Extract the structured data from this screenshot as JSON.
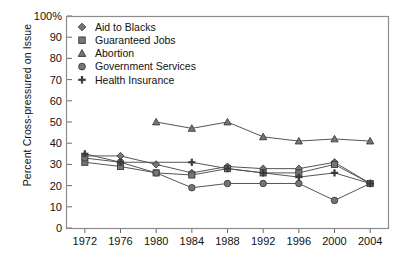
{
  "chart_data": {
    "type": "line",
    "title": "",
    "xlabel": "",
    "ylabel": "Percent Cross-pressured on Issue",
    "x": [
      1972,
      1976,
      1980,
      1984,
      1988,
      1992,
      1996,
      2000,
      2004
    ],
    "xticklabels": [
      "1972",
      "1976",
      "1980",
      "1984",
      "1988",
      "1992",
      "1996",
      "2000",
      "2004"
    ],
    "yticklabels": [
      "0",
      "10",
      "20",
      "30",
      "40",
      "50",
      "60",
      "70",
      "80",
      "90",
      "100%"
    ],
    "yticks": [
      0,
      10,
      20,
      30,
      40,
      50,
      60,
      70,
      80,
      90,
      100
    ],
    "ylim": [
      0,
      100
    ],
    "xlim": [
      1970,
      2006
    ],
    "grid": false,
    "legend_position": "top-left",
    "series": [
      {
        "name": "Aid to Blacks",
        "marker": "diamond",
        "x": [
          1972,
          1976,
          1980,
          1984,
          1988,
          1992,
          1996,
          2000,
          2004
        ],
        "values": [
          34,
          34,
          30,
          26,
          29,
          28,
          28,
          31,
          21
        ]
      },
      {
        "name": "Guaranteed Jobs",
        "marker": "square",
        "x": [
          1972,
          1976,
          1980,
          1984,
          1988,
          1992,
          1996,
          2000,
          2004
        ],
        "values": [
          31,
          29,
          26,
          25,
          28,
          26,
          26,
          30,
          21
        ]
      },
      {
        "name": "Abortion",
        "marker": "triangle",
        "x": [
          1980,
          1984,
          1988,
          1992,
          1996,
          2000,
          2004
        ],
        "values": [
          50,
          47,
          50,
          43,
          41,
          42,
          41
        ]
      },
      {
        "name": "Government Services",
        "marker": "circle",
        "x": [
          1972,
          1976,
          1980,
          1984,
          1988,
          1992,
          1996,
          2000,
          2004
        ],
        "values": [
          33,
          31,
          26,
          19,
          21,
          21,
          21,
          13,
          21
        ]
      },
      {
        "name": "Health Insurance",
        "marker": "plus",
        "x": [
          1972,
          1976,
          1984,
          1988,
          1992,
          1996,
          2000,
          2004
        ],
        "values": [
          35,
          31,
          31,
          28,
          26,
          24,
          26,
          21
        ]
      }
    ]
  },
  "legend": {
    "items": [
      {
        "label": "Aid to Blacks",
        "marker": "diamond"
      },
      {
        "label": "Guaranteed Jobs",
        "marker": "square"
      },
      {
        "label": "Abortion",
        "marker": "triangle"
      },
      {
        "label": "Government Services",
        "marker": "circle"
      },
      {
        "label": "Health Insurance",
        "marker": "plus"
      }
    ]
  },
  "axis": {
    "y_label": "Percent Cross-pressured on Issue",
    "y_ticks": [
      "100%",
      "90",
      "80",
      "70",
      "60",
      "50",
      "40",
      "30",
      "20",
      "10",
      "0"
    ],
    "x_ticks": [
      "1972",
      "1976",
      "1980",
      "1984",
      "1988",
      "1992",
      "1996",
      "2000",
      "2004"
    ]
  }
}
